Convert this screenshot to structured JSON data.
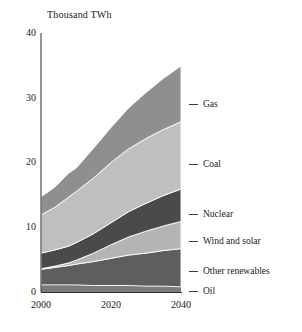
{
  "chart_data": {
    "type": "area",
    "title": "Thousand TWh",
    "xlabel": "",
    "ylabel": "Thousand TWh",
    "xlim": [
      2000,
      2040
    ],
    "ylim": [
      0,
      40
    ],
    "xticks": [
      "2000",
      "2020",
      "2040"
    ],
    "yticks": [
      "0",
      "10",
      "20",
      "30",
      "40"
    ],
    "grid": false,
    "legend_position": "right",
    "stacked": true,
    "x": [
      2000,
      2004,
      2008,
      2010,
      2015,
      2020,
      2025,
      2030,
      2035,
      2040
    ],
    "series": [
      {
        "name": "Oil",
        "color": "#7a7a7a",
        "values": [
          1.1,
          1.1,
          1.1,
          1.1,
          1.0,
          1.0,
          1.0,
          0.9,
          0.9,
          0.8
        ]
      },
      {
        "name": "Other renewables",
        "color": "#5e5e5e",
        "values": [
          2.4,
          2.7,
          3.0,
          3.2,
          3.7,
          4.2,
          4.7,
          5.1,
          5.5,
          5.9
        ]
      },
      {
        "name": "Wind and solar",
        "color": "#b4b4b4",
        "values": [
          0.1,
          0.2,
          0.4,
          0.6,
          1.3,
          2.1,
          2.8,
          3.4,
          3.8,
          4.2
        ]
      },
      {
        "name": "Nuclear",
        "color": "#4a4a4a",
        "values": [
          2.4,
          2.5,
          2.6,
          2.7,
          3.0,
          3.4,
          3.9,
          4.3,
          4.7,
          5.0
        ]
      },
      {
        "name": "Coal",
        "color": "#bfbfbf",
        "values": [
          5.9,
          6.6,
          7.6,
          7.9,
          8.6,
          9.3,
          9.7,
          10.0,
          10.2,
          10.4
        ]
      },
      {
        "name": "Gas",
        "color": "#8f8f8f",
        "values": [
          2.8,
          3.1,
          3.7,
          3.6,
          4.6,
          5.4,
          6.3,
          7.1,
          7.9,
          8.6
        ]
      }
    ],
    "totals": [
      14.7,
      16.2,
      18.4,
      19.1,
      22.2,
      25.4,
      28.4,
      30.8,
      33.0,
      34.9
    ],
    "annotations": []
  },
  "legend": {
    "items": [
      {
        "label": "Gas",
        "top": 99
      },
      {
        "label": "Coal",
        "top": 159
      },
      {
        "label": "Nuclear",
        "top": 209
      },
      {
        "label": "Wind and solar",
        "top": 236
      },
      {
        "label": "Other renewables",
        "top": 266
      },
      {
        "label": "Oil",
        "top": 286
      }
    ]
  },
  "axes": {
    "y_ticks": [
      {
        "label": "40",
        "top": 28
      },
      {
        "label": "30",
        "top": 93
      },
      {
        "label": "20",
        "top": 157
      },
      {
        "label": "10",
        "top": 222
      },
      {
        "label": "0",
        "top": 287
      }
    ],
    "x_ticks": [
      {
        "label": "2000",
        "left": 21
      },
      {
        "label": "2020",
        "left": 91
      },
      {
        "label": "2040",
        "left": 161
      }
    ]
  }
}
